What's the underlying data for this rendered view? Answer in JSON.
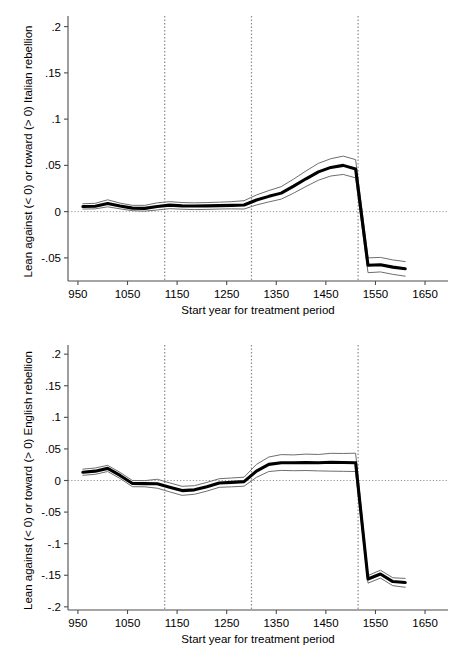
{
  "figure": {
    "panels": [
      "top",
      "bottom"
    ]
  },
  "chart_data": [
    {
      "id": "top",
      "type": "line",
      "title": "",
      "xlabel": "Start year for treatment period",
      "ylabel": "Lean against (< 0) or toward (> 0) Italian rebellion",
      "xlim": [
        930,
        1660
      ],
      "ylim": [
        -0.075,
        0.205
      ],
      "xticks": [
        950,
        1050,
        1150,
        1250,
        1350,
        1450,
        1550,
        1650
      ],
      "xticklabels": [
        "950",
        "1050",
        "1150",
        "1250",
        "1350",
        "1450",
        "1550",
        "1650"
      ],
      "yticks": [
        0.2,
        0.15,
        0.1,
        0.05,
        0,
        -0.05
      ],
      "yticklabels": [
        ".2",
        ".15",
        ".1",
        ".05",
        "0",
        "-.05"
      ],
      "grid": false,
      "legend": "none",
      "zero_reference_line": 0,
      "vertical_reference_lines": [
        1125,
        1300,
        1515
      ],
      "x": [
        960,
        985,
        1010,
        1035,
        1060,
        1085,
        1110,
        1135,
        1160,
        1185,
        1210,
        1235,
        1260,
        1285,
        1310,
        1335,
        1360,
        1385,
        1410,
        1435,
        1460,
        1485,
        1510,
        1535,
        1560,
        1585,
        1610
      ],
      "series": [
        {
          "name": "estimate",
          "role": "point-estimate",
          "values": [
            0.0055,
            0.0058,
            0.0088,
            0.006,
            0.0038,
            0.0035,
            0.0055,
            0.007,
            0.0062,
            0.006,
            0.0062,
            0.0065,
            0.0068,
            0.0072,
            0.0125,
            0.0165,
            0.02,
            0.0275,
            0.0355,
            0.043,
            0.0478,
            0.05,
            0.0462,
            -0.058,
            -0.0575,
            -0.06,
            -0.0618
          ]
        },
        {
          "name": "upper 95% CI",
          "role": "confidence-upper",
          "values": [
            0.0085,
            0.009,
            0.0128,
            0.0092,
            0.0068,
            0.0068,
            0.0095,
            0.0108,
            0.0098,
            0.0095,
            0.0098,
            0.0102,
            0.0108,
            0.0118,
            0.018,
            0.0228,
            0.027,
            0.0352,
            0.044,
            0.0522,
            0.0572,
            0.06,
            0.0562,
            -0.05,
            -0.0495,
            -0.0522,
            -0.054
          ]
        },
        {
          "name": "lower 95% CI",
          "role": "confidence-lower",
          "values": [
            0.0028,
            0.003,
            0.0052,
            0.003,
            0.001,
            0.0005,
            0.0018,
            0.0032,
            0.0026,
            0.0022,
            0.0024,
            0.0028,
            0.003,
            0.0028,
            0.0072,
            0.0105,
            0.0135,
            0.02,
            0.0272,
            0.034,
            0.0385,
            0.0402,
            0.0365,
            -0.066,
            -0.0652,
            -0.0678,
            -0.0698
          ]
        }
      ]
    },
    {
      "id": "bottom",
      "type": "line",
      "title": "",
      "xlabel": "Start year for treatment period",
      "ylabel": "Lean against (< 0) or toward (> 0) English rebellion",
      "xlim": [
        930,
        1660
      ],
      "ylim": [
        -0.205,
        0.205
      ],
      "xticks": [
        950,
        1050,
        1150,
        1250,
        1350,
        1450,
        1550,
        1650
      ],
      "xticklabels": [
        "950",
        "1050",
        "1150",
        "1250",
        "1350",
        "1450",
        "1550",
        "1650"
      ],
      "yticks": [
        0.2,
        0.15,
        0.1,
        0.05,
        0,
        -0.05,
        -0.1,
        -0.15,
        -0.2
      ],
      "yticklabels": [
        ".2",
        ".15",
        ".1",
        ".05",
        "0",
        "-.05",
        "-.1",
        "-.15",
        "-.2"
      ],
      "grid": false,
      "legend": "none",
      "zero_reference_line": 0,
      "vertical_reference_lines": [
        1125,
        1300,
        1515
      ],
      "x": [
        960,
        985,
        1010,
        1035,
        1060,
        1085,
        1110,
        1135,
        1160,
        1185,
        1210,
        1235,
        1260,
        1285,
        1310,
        1335,
        1360,
        1385,
        1410,
        1435,
        1460,
        1485,
        1510,
        1535,
        1560,
        1585,
        1610
      ],
      "series": [
        {
          "name": "estimate",
          "role": "point-estimate",
          "values": [
            0.013,
            0.0148,
            0.0192,
            0.008,
            -0.0048,
            -0.005,
            -0.0052,
            -0.0108,
            -0.016,
            -0.0148,
            -0.0098,
            -0.004,
            -0.003,
            -0.0018,
            0.0148,
            0.0255,
            0.0282,
            0.028,
            0.0285,
            0.0282,
            0.0288,
            0.0285,
            0.0282,
            -0.156,
            -0.148,
            -0.16,
            -0.1615
          ]
        },
        {
          "name": "upper 95% CI",
          "role": "confidence-upper",
          "values": [
            0.018,
            0.0198,
            0.024,
            0.0128,
            0.0,
            -0.0002,
            0.002,
            -0.0038,
            -0.0092,
            -0.0082,
            -0.003,
            0.0028,
            0.004,
            0.0052,
            0.0255,
            0.0372,
            0.041,
            0.0405,
            0.0418,
            0.0412,
            0.043,
            0.0428,
            0.0432,
            -0.1505,
            -0.142,
            -0.154,
            -0.155
          ]
        },
        {
          "name": "lower 95% CI",
          "role": "confidence-lower",
          "values": [
            0.0082,
            0.0098,
            0.0142,
            0.0032,
            -0.0098,
            -0.01,
            -0.0122,
            -0.018,
            -0.0235,
            -0.0218,
            -0.0168,
            -0.0108,
            -0.01,
            -0.009,
            0.005,
            0.0142,
            0.016,
            0.0155,
            0.0158,
            0.0152,
            0.0148,
            0.0145,
            0.0142,
            -0.1625,
            -0.1545,
            -0.1665,
            -0.169
          ]
        }
      ]
    }
  ]
}
